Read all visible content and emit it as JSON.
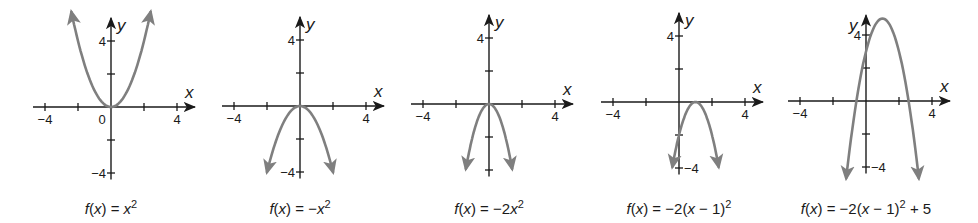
{
  "chart_data": [
    {
      "type": "line",
      "title": "f(x) = x^2",
      "caption": {
        "pre": "f",
        "mid": "(",
        "var": "x",
        "post": ") = ",
        "expr_var": "x",
        "expr_tail": "",
        "sup": "2",
        "after": ""
      },
      "xlabel": "x",
      "ylabel": "y",
      "xlim": [
        -4,
        4
      ],
      "ylim": [
        -4,
        4
      ],
      "x_ticks": [
        -4,
        -2,
        0,
        2,
        4
      ],
      "y_ticks": [
        -4,
        -2,
        2,
        4
      ],
      "x_tick_labels": [
        "-4",
        "0",
        "4"
      ],
      "y_tick_labels": [
        "4",
        "-4"
      ],
      "series": [
        {
          "name": "f(x) = x^2",
          "a": 1,
          "h": 0,
          "k": 0,
          "x": [
            -2.4,
            -2,
            -1,
            0,
            1,
            2,
            2.4
          ],
          "y": [
            5.76,
            4,
            1,
            0,
            1,
            4,
            5.76
          ]
        }
      ],
      "vertex": [
        0,
        0
      ],
      "opens": "up",
      "layout": {
        "ox": 111,
        "oy": 107,
        "unit": 16.5
      }
    },
    {
      "type": "line",
      "title": "f(x) = -x^2",
      "caption": {
        "pre": "f",
        "mid": "(",
        "var": "x",
        "post": ") = −",
        "expr_var": "x",
        "expr_tail": "",
        "sup": "2",
        "after": ""
      },
      "xlabel": "x",
      "ylabel": "y",
      "xlim": [
        -4,
        4
      ],
      "ylim": [
        -4,
        4
      ],
      "x_ticks": [
        -4,
        -2,
        0,
        2,
        4
      ],
      "y_ticks": [
        -4,
        -2,
        2,
        4
      ],
      "x_tick_labels": [
        "-4",
        "4"
      ],
      "y_tick_labels": [
        "4",
        "-4"
      ],
      "series": [
        {
          "name": "f(x) = -x^2",
          "a": -1,
          "h": 0,
          "k": 0,
          "x": [
            -2,
            -1,
            0,
            1,
            2
          ],
          "y": [
            -4,
            -1,
            0,
            -1,
            -4
          ]
        }
      ],
      "vertex": [
        0,
        0
      ],
      "opens": "down",
      "layout": {
        "ox": 300,
        "oy": 106,
        "unit": 16.5
      }
    },
    {
      "type": "line",
      "title": "f(x) = -2x^2",
      "caption": {
        "pre": "f",
        "mid": "(",
        "var": "x",
        "post": ") = −2",
        "expr_var": "x",
        "expr_tail": "",
        "sup": "2",
        "after": ""
      },
      "xlabel": "x",
      "ylabel": "y",
      "xlim": [
        -4,
        4
      ],
      "ylim": [
        -4,
        4
      ],
      "x_ticks": [
        -4,
        -2,
        0,
        2,
        4
      ],
      "y_ticks": [
        -4,
        -2,
        2,
        4
      ],
      "x_tick_labels": [
        "-4",
        "4"
      ],
      "y_tick_labels": [
        "4"
      ],
      "series": [
        {
          "name": "f(x) = -2x^2",
          "a": -2,
          "h": 0,
          "k": 0,
          "x": [
            -1.4,
            -1,
            0,
            1,
            1.4
          ],
          "y": [
            -3.92,
            -2,
            0,
            -2,
            -3.92
          ]
        }
      ],
      "vertex": [
        0,
        0
      ],
      "opens": "down",
      "layout": {
        "ox": 489,
        "oy": 104,
        "unit": 16.5
      }
    },
    {
      "type": "line",
      "title": "f(x) = -2(x-1)^2",
      "caption": {
        "pre": "f",
        "mid": "(",
        "var": "x",
        "post": ") = −2(",
        "expr_var": "x",
        "expr_tail": " − 1)",
        "sup": "2",
        "after": ""
      },
      "xlabel": "x",
      "ylabel": "y",
      "xlim": [
        -4,
        4
      ],
      "ylim": [
        -4,
        4
      ],
      "x_ticks": [
        -4,
        -2,
        0,
        2,
        4
      ],
      "y_ticks": [
        -4,
        -2,
        2,
        4
      ],
      "x_tick_labels": [
        "-4",
        "4"
      ],
      "y_tick_labels": [
        "4",
        "-4"
      ],
      "series": [
        {
          "name": "f(x) = -2(x-1)^2",
          "a": -2,
          "h": 1,
          "k": 0,
          "x": [
            -0.4,
            0,
            1,
            2,
            2.4
          ],
          "y": [
            -3.92,
            -2,
            0,
            -2,
            -3.92
          ]
        }
      ],
      "vertex": [
        1,
        0
      ],
      "opens": "down",
      "layout": {
        "ox": 679,
        "oy": 102,
        "unit": 16.5
      }
    },
    {
      "type": "line",
      "title": "f(x) = -2(x-1)^2 + 5",
      "caption": {
        "pre": "f",
        "mid": "(",
        "var": "x",
        "post": ") = −2(",
        "expr_var": "x",
        "expr_tail": " − 1)",
        "sup": "2",
        "after": " + 5"
      },
      "xlabel": "x",
      "ylabel": "y",
      "xlim": [
        -4,
        4
      ],
      "ylim": [
        -4,
        5
      ],
      "x_ticks": [
        -4,
        -2,
        0,
        2,
        4
      ],
      "y_ticks": [
        -4,
        -2,
        2,
        4
      ],
      "x_tick_labels": [
        "-4",
        "4"
      ],
      "y_tick_labels": [
        "4",
        "-4"
      ],
      "series": [
        {
          "name": "f(x) = -2(x-1)^2 + 5",
          "a": -2,
          "h": 1,
          "k": 5,
          "x": [
            -1.2,
            0,
            1,
            2,
            3.2
          ],
          "y": [
            -4.68,
            3,
            5,
            3,
            -4.68
          ]
        }
      ],
      "vertex": [
        1,
        5
      ],
      "opens": "down",
      "layout": {
        "ox": 866,
        "oy": 101,
        "unit": 16.5
      }
    }
  ],
  "colors": {
    "axis": "#1a1a1a",
    "curve": "#7f7f7f",
    "background": "#ffffff"
  }
}
